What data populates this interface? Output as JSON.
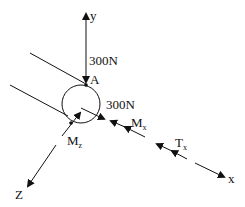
{
  "diagram": {
    "type": "free-body-diagram",
    "axes": {
      "y": "y",
      "x": "x",
      "z": "Z"
    },
    "point": "A",
    "forces": [
      {
        "label": "300N",
        "direction": "downward along -y at A"
      },
      {
        "label": "300N",
        "direction": "along x direction at shaft surface"
      }
    ],
    "moments": [
      {
        "label": "M",
        "sub": "x"
      },
      {
        "label": "M",
        "sub": "z"
      }
    ],
    "torque": {
      "label": "T",
      "sub": "x"
    },
    "colors": {
      "line": "#111111",
      "background": "#ffffff"
    }
  }
}
